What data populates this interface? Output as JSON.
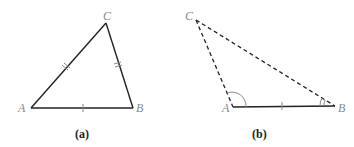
{
  "figure": {
    "panels": [
      {
        "id": "a",
        "caption": "(a)",
        "vertices": {
          "A": "A",
          "B": "B",
          "C": "C"
        },
        "edges": [
          {
            "from": "A",
            "to": "B",
            "style": "solid",
            "tick_marks": 1
          },
          {
            "from": "A",
            "to": "C",
            "style": "solid",
            "tick_marks": 2
          },
          {
            "from": "C",
            "to": "B",
            "style": "solid",
            "tick_marks": 2
          }
        ]
      },
      {
        "id": "b",
        "caption": "(b)",
        "vertices": {
          "A": "A",
          "B": "B",
          "C": "C"
        },
        "edges": [
          {
            "from": "A",
            "to": "B",
            "style": "solid",
            "tick_marks": 1
          },
          {
            "from": "A",
            "to": "C",
            "style": "dashed",
            "tick_marks": 0
          },
          {
            "from": "C",
            "to": "B",
            "style": "dashed",
            "tick_marks": 0
          }
        ],
        "angle_marks": [
          "A",
          "B"
        ]
      }
    ],
    "colors": {
      "line": "#222222",
      "label": "#8a8a8a",
      "background": "#ffffff"
    }
  }
}
